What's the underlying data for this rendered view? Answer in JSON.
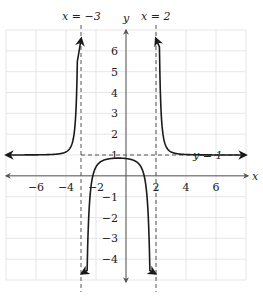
{
  "chart_data": {
    "type": "line",
    "title": "",
    "xlabel": "x",
    "ylabel": "y",
    "xlim": [
      -8,
      8
    ],
    "ylim": [
      -5,
      7
    ],
    "grid": true,
    "x_ticks": [
      -6,
      -4,
      -2,
      2,
      4,
      6
    ],
    "y_ticks": [
      -4,
      -3,
      -2,
      -1,
      1,
      2,
      3,
      4,
      5,
      6
    ],
    "vertical_asymptotes": [
      {
        "x": -3,
        "label": "x = −3"
      },
      {
        "x": 2,
        "label": "x = 2"
      }
    ],
    "horizontal_asymptote": {
      "y": 1,
      "label": "y = 1"
    },
    "series": [
      {
        "name": "left-branch",
        "domain": [
          -8,
          -3
        ],
        "behavior": "approaches y=1 from above as x→−∞, rises to +∞ as x→−3⁻"
      },
      {
        "name": "middle-branch",
        "domain": [
          -3,
          2
        ],
        "behavior": "flat near y≈0.85, falls to −∞ at both x→−3⁺ and x→2⁻"
      },
      {
        "name": "right-branch",
        "domain": [
          2,
          8
        ],
        "behavior": "rises to +∞ as x→2⁺, approaches y=1 from above as x→+∞"
      }
    ]
  },
  "labels": {
    "x_axis": "x",
    "y_axis": "y",
    "asym_left": "x = −3",
    "asym_right": "x = 2",
    "asym_h": "y = 1"
  },
  "colors": {
    "grid": "#e6e6e6",
    "axis": "#555555",
    "curve": "#1a1a1a",
    "asymptote": "#555555"
  }
}
